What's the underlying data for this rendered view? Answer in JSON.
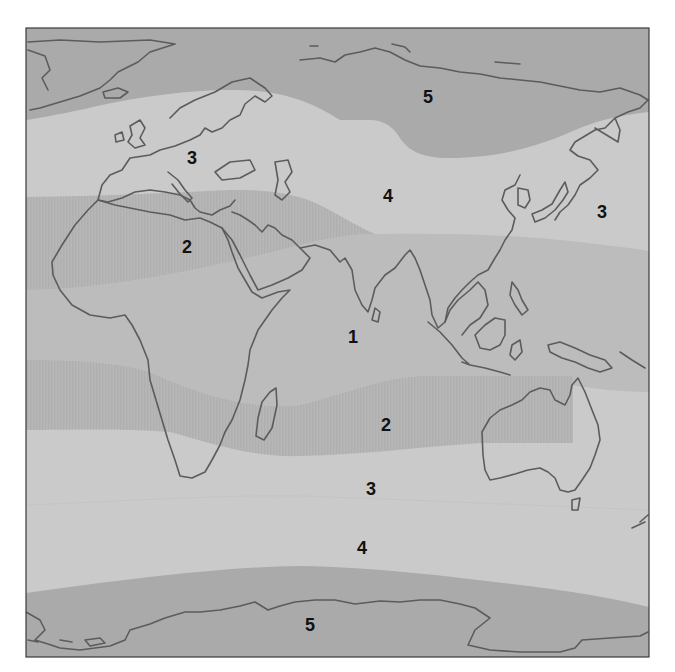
{
  "map": {
    "type": "world climate zone map (grayscale)",
    "colors": {
      "zone5": "#aaaaaa",
      "zone3_4": "#cacaca",
      "zone1": "#bcbcbc",
      "zone2": "#b6b6b6",
      "zone2_hatch": "#adadad",
      "coastline": "#5c5c5c",
      "frame": "#3a3a3a",
      "label": "#111111"
    },
    "labels": [
      {
        "id": "label-5-north",
        "text": "5",
        "x": 428,
        "y": 97
      },
      {
        "id": "label-3-europe",
        "text": "3",
        "x": 192,
        "y": 158
      },
      {
        "id": "label-4-asia",
        "text": "4",
        "x": 388,
        "y": 196
      },
      {
        "id": "label-3-pacific",
        "text": "3",
        "x": 602,
        "y": 212
      },
      {
        "id": "label-2-sahara",
        "text": "2",
        "x": 187,
        "y": 247
      },
      {
        "id": "label-1-indian-ocean",
        "text": "1",
        "x": 353,
        "y": 337
      },
      {
        "id": "label-2-south",
        "text": "2",
        "x": 386,
        "y": 425
      },
      {
        "id": "label-3-south",
        "text": "3",
        "x": 371,
        "y": 489
      },
      {
        "id": "label-4-south",
        "text": "4",
        "x": 362,
        "y": 548
      },
      {
        "id": "label-5-antarctic",
        "text": "5",
        "x": 310,
        "y": 625
      }
    ]
  }
}
